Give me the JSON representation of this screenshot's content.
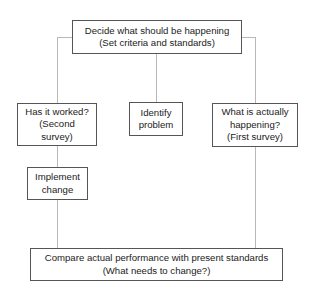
{
  "diagram": {
    "nodes": {
      "top": {
        "lines": [
          "Decide what should be happening",
          "(Set criteria and standards)"
        ]
      },
      "left": {
        "lines": [
          "Has it worked?",
          "(Second",
          "survey)"
        ]
      },
      "middle": {
        "lines": [
          "Identify",
          "problem"
        ]
      },
      "right": {
        "lines": [
          "What is actually",
          "happening?",
          "(First survey)"
        ]
      },
      "implement": {
        "lines": [
          "Implement",
          "change"
        ]
      },
      "bottom": {
        "lines": [
          "Compare actual performance with present standards",
          "(What needs to change?)"
        ]
      }
    },
    "edges": [
      [
        "top",
        "left"
      ],
      [
        "top",
        "middle"
      ],
      [
        "top",
        "right"
      ],
      [
        "left",
        "implement"
      ],
      [
        "implement",
        "bottom"
      ],
      [
        "right",
        "bottom"
      ]
    ],
    "colors": {
      "box_border": "#555555",
      "connector": "#b8b8b8",
      "text": "#222222"
    }
  }
}
